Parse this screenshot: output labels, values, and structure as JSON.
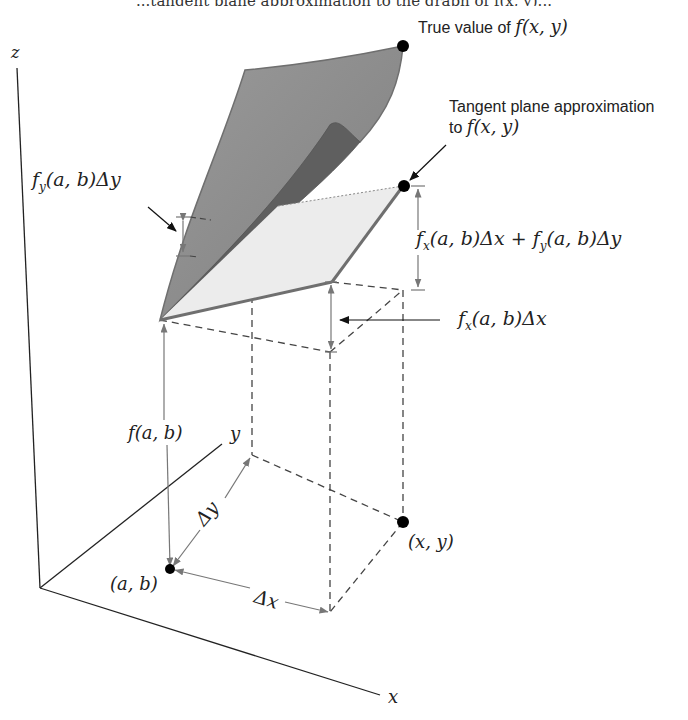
{
  "caption_fragment": "...tangent plane approximation to the graph of f(x, y)...",
  "labels": {
    "z_axis": "z",
    "x_axis": "x",
    "y_axis": "y",
    "true_value": "True value of ",
    "true_value_math": "f(x, y)",
    "tangent_line1": "Tangent plane approximation",
    "tangent_line2_prefix": "to ",
    "tangent_line2_math": "f(x, y)",
    "fy_delta_y": "f",
    "fy_sub": "y",
    "fy_rest": "(a, b)Δy",
    "fx_sub": "x",
    "fx_rest_plus": "(a, b)Δx + ",
    "fy_rest2": "(a, b)Δy",
    "fx_delta_x": "(a, b)Δx",
    "f_ab": "f(a, b)",
    "delta_x": "Δx",
    "delta_y": "Δy",
    "point_ab": "(a, b)",
    "point_xy": "(x, y)"
  },
  "colors": {
    "surface_top": "#8e8e8e",
    "surface_fold": "#6b6b6b",
    "plane_fill": "#ececec",
    "edge": "#6f6f6f",
    "axis": "#222222",
    "dashed": "#444444",
    "arrow_gray": "#777777"
  }
}
